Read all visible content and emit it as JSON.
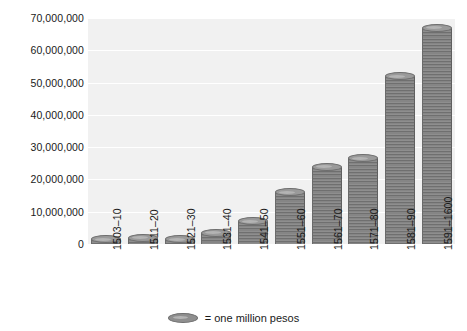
{
  "chart_data": {
    "type": "bar",
    "title": "",
    "xlabel": "",
    "ylabel": "",
    "categories": [
      "1503–10",
      "1511–20",
      "1521–30",
      "1531–40",
      "1541–50",
      "1551–60",
      "1561–70",
      "1571–80",
      "1581–90",
      "1591–1600"
    ],
    "values": [
      1200000,
      2000000,
      1500000,
      3500000,
      7000000,
      16000000,
      24000000,
      26500000,
      52000000,
      67000000
    ],
    "ylim": [
      0,
      70000000
    ],
    "yticks": [
      0,
      10000000,
      20000000,
      30000000,
      40000000,
      50000000,
      60000000,
      70000000
    ],
    "ytick_labels": [
      "0",
      "10,000,000",
      "20,000,000",
      "30,000,000",
      "40,000,000",
      "50,000,000",
      "60,000,000",
      "70,000,000"
    ],
    "grid": true,
    "legend_position": "bottom",
    "legend": [
      {
        "marker": "coin-stack-icon",
        "label": "= one million pesos"
      }
    ],
    "unit_note": "each coin = one million pesos"
  },
  "colors": {
    "plot_background": "#f1f1f1",
    "gridline": "#ffffff",
    "coin_fill": "#8e8e8e",
    "coin_edge": "#6a6a6a",
    "page_background": "#ffffff",
    "text": "#1a1a1a"
  }
}
